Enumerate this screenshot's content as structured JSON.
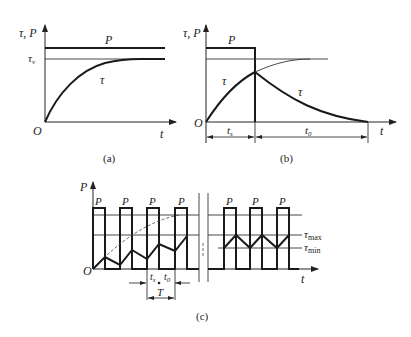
{
  "panels": {
    "a": {
      "caption": "(a)",
      "y_axis_label": "τ, P",
      "x_axis_label": "t",
      "origin_label": "O",
      "power_label": "P",
      "steady_temp_label": "τ",
      "steady_temp_subscript": "v",
      "curve_label": "τ"
    },
    "b": {
      "caption": "(b)",
      "y_axis_label": "τ, P",
      "x_axis_label": "t",
      "origin_label": "O",
      "power_label": "P",
      "heating_curve_label": "τ",
      "cooling_curve_label": "τ",
      "on_time_label": "t",
      "on_time_subscript": "s",
      "off_time_label": "t",
      "off_time_subscript": "0"
    },
    "c": {
      "caption": "(c)",
      "y_axis_label": "P",
      "x_axis_label": "t",
      "origin_label": "O",
      "pulse_labels": [
        "P",
        "P",
        "P",
        "P",
        "P",
        "P",
        "P"
      ],
      "tau_max_label": "τ",
      "tau_max_subscript": "max",
      "tau_min_label": "τ",
      "tau_min_subscript": "min",
      "on_time_label": "t",
      "on_time_subscript": "s",
      "off_time_label": "t",
      "off_time_subscript": "0",
      "period_label": "T"
    }
  },
  "colors": {
    "line": "#1a1a1a",
    "background": "#ffffff"
  }
}
